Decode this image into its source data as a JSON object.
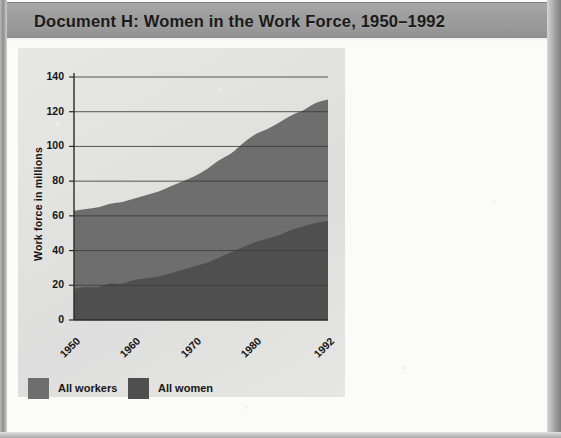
{
  "document": {
    "title": "Document H: Women in the Work Force, 1950–1992"
  },
  "colors": {
    "header_band": "#9e9e9e",
    "panel_bg": "#e3e3e1",
    "all_workers": "#6e6e6e",
    "all_women": "#4f4f4f",
    "gridline": "#3c3c3c",
    "text": "#141414"
  },
  "chart_data": {
    "type": "area",
    "title": "",
    "xlabel": "",
    "ylabel": "Work force in millions",
    "xlim": [
      1950,
      1992
    ],
    "ylim": [
      0,
      140
    ],
    "ytick_labels": [
      "0",
      "20",
      "40",
      "60",
      "80",
      "100",
      "120",
      "140"
    ],
    "ytick_values": [
      0,
      20,
      40,
      60,
      80,
      100,
      120,
      140
    ],
    "xtick_labels": [
      "1950",
      "1960",
      "1970",
      "1980",
      "1992"
    ],
    "xtick_values": [
      1950,
      1960,
      1970,
      1980,
      1992
    ],
    "grid": true,
    "legend_position": "below-left",
    "stacked": false,
    "x": [
      1950,
      1952,
      1954,
      1956,
      1958,
      1960,
      1962,
      1964,
      1966,
      1968,
      1970,
      1972,
      1974,
      1976,
      1978,
      1980,
      1982,
      1984,
      1986,
      1988,
      1990,
      1992
    ],
    "series": [
      {
        "name": "All workers",
        "color": "#6e6e6e",
        "values": [
          63,
          64,
          65,
          67,
          68,
          70,
          72,
          74,
          77,
          80,
          83,
          87,
          92,
          96,
          102,
          107,
          110,
          114,
          118,
          121,
          125,
          127
        ]
      },
      {
        "name": "All women",
        "color": "#4f4f4f",
        "values": [
          18,
          19,
          19,
          21,
          21,
          23,
          24,
          25,
          27,
          29,
          31,
          33,
          36,
          39,
          42,
          45,
          47,
          49,
          52,
          54,
          56,
          57
        ]
      }
    ]
  },
  "legend": {
    "items": [
      {
        "label": "All workers",
        "color": "#6e6e6e"
      },
      {
        "label": "All women",
        "color": "#4f4f4f"
      }
    ]
  }
}
